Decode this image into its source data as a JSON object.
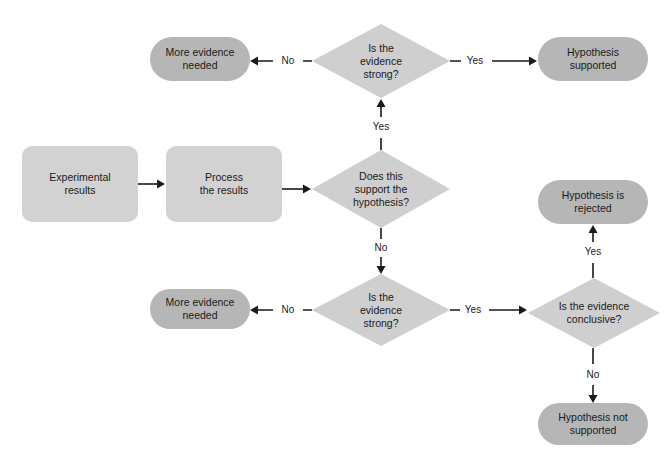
{
  "diagram": {
    "colors": {
      "terminal_fill": "#b6b6b6",
      "process_fill": "#d2d2d2",
      "decision_fill": "#cfcfcf",
      "line": "#1a1a1a",
      "background": "#ffffff",
      "text": "#1a1a1a"
    },
    "nodes": [
      {
        "id": "more-evidence-needed-top",
        "shape": "rounded-terminal",
        "label": "More evidence\nneeded",
        "x": 150,
        "y": 37,
        "w": 100,
        "h": 44,
        "fill": "#b6b6b6"
      },
      {
        "id": "is-the-evidence-strong-top",
        "shape": "diamond",
        "label": "Is the\nevidence\nstrong?",
        "x": 312,
        "y": 24,
        "w": 138,
        "h": 74,
        "fill": "#cfcfcf"
      },
      {
        "id": "hypothesis-supported",
        "shape": "rounded-terminal",
        "label": "Hypothesis\nsupported",
        "x": 538,
        "y": 37,
        "w": 110,
        "h": 44,
        "fill": "#b6b6b6"
      },
      {
        "id": "experimental-results",
        "shape": "process",
        "label": "Experimental\nresults",
        "x": 22,
        "y": 146,
        "w": 116,
        "h": 76,
        "fill": "#d2d2d2"
      },
      {
        "id": "process-the-results",
        "shape": "process",
        "label": "Process\nthe results",
        "x": 166,
        "y": 146,
        "w": 116,
        "h": 76,
        "fill": "#d2d2d2"
      },
      {
        "id": "does-this-support-the-hypothesis",
        "shape": "diamond",
        "label": "Does this\nsupport the\nhypothesis?",
        "x": 312,
        "y": 150,
        "w": 138,
        "h": 78,
        "fill": "#cfcfcf"
      },
      {
        "id": "hypothesis-is-rejected",
        "shape": "rounded-terminal",
        "label": "Hypothesis is\nrejected",
        "x": 538,
        "y": 180,
        "w": 110,
        "h": 44,
        "fill": "#b6b6b6"
      },
      {
        "id": "more-evidence-needed-bottom",
        "shape": "rounded-terminal",
        "label": "More evidence\nneeded",
        "x": 150,
        "y": 289,
        "w": 100,
        "h": 40,
        "fill": "#b6b6b6"
      },
      {
        "id": "is-the-evidence-strong-bottom",
        "shape": "diamond",
        "label": "Is the\nevidence\nstrong?",
        "x": 312,
        "y": 274,
        "w": 138,
        "h": 72,
        "fill": "#cfcfcf"
      },
      {
        "id": "is-the-evidence-conclusive",
        "shape": "diamond",
        "label": "Is the evidence\nconclusive?",
        "x": 528,
        "y": 278,
        "w": 132,
        "h": 70,
        "fill": "#cfcfcf"
      },
      {
        "id": "hypothesis-not-supported",
        "shape": "rounded-terminal",
        "label": "Hypothesis not\nsupported",
        "x": 538,
        "y": 403,
        "w": 110,
        "h": 42,
        "fill": "#b6b6b6"
      }
    ],
    "edges": [
      {
        "id": "edge-strong-top-to-more-evidence",
        "from": "is-the-evidence-strong-top",
        "to": "more-evidence-needed-top",
        "label": "No",
        "label_x": 288,
        "label_y": 61,
        "path": "M 312 61 L 303 61 M 273 61 L 256 61",
        "arrow": "left",
        "arrow_x": 250,
        "arrow_y": 61
      },
      {
        "id": "edge-strong-top-to-hypothesis-supported",
        "from": "is-the-evidence-strong-top",
        "to": "hypothesis-supported",
        "label": "Yes",
        "label_x": 475,
        "label_y": 61,
        "path": "M 450 61 L 461 61 M 492 61 L 531 61",
        "arrow": "right",
        "arrow_x": 537,
        "arrow_y": 61
      },
      {
        "id": "edge-support-hypothesis-yes-up",
        "from": "does-this-support-the-hypothesis",
        "to": "is-the-evidence-strong-top",
        "label": "Yes",
        "label_x": 381,
        "label_y": 127,
        "path": "M 381 150 L 381 138 M 381 117 L 381 106",
        "arrow": "up",
        "arrow_x": 381,
        "arrow_y": 99
      },
      {
        "id": "edge-experimental-to-process",
        "from": "experimental-results",
        "to": "process-the-results",
        "label": "",
        "label_x": 152,
        "label_y": 184,
        "path": "M 138 184 L 159 184",
        "arrow": "right",
        "arrow_x": 165,
        "arrow_y": 184
      },
      {
        "id": "edge-process-to-decision",
        "from": "process-the-results",
        "to": "does-this-support-the-hypothesis",
        "label": "",
        "label_x": 297,
        "label_y": 189,
        "path": "M 282 189 L 305 189",
        "arrow": "right",
        "arrow_x": 311,
        "arrow_y": 189
      },
      {
        "id": "edge-support-hypothesis-no-down",
        "from": "does-this-support-the-hypothesis",
        "to": "is-the-evidence-strong-bottom",
        "label": "No",
        "label_x": 381,
        "label_y": 248,
        "path": "M 381 228 L 381 239 M 381 257 L 381 267",
        "arrow": "down",
        "arrow_x": 381,
        "arrow_y": 274
      },
      {
        "id": "edge-strong-bottom-to-more-evidence",
        "from": "is-the-evidence-strong-bottom",
        "to": "more-evidence-needed-bottom",
        "label": "No",
        "label_x": 288,
        "label_y": 310,
        "path": "M 312 310 L 303 310 M 273 310 L 256 310",
        "arrow": "left",
        "arrow_x": 250,
        "arrow_y": 310
      },
      {
        "id": "edge-strong-bottom-to-conclusive",
        "from": "is-the-evidence-strong-bottom",
        "to": "is-the-evidence-conclusive",
        "label": "Yes",
        "label_x": 473,
        "label_y": 310,
        "path": "M 450 310 L 460 310 M 489 310 L 521 310",
        "arrow": "right",
        "arrow_x": 527,
        "arrow_y": 310
      },
      {
        "id": "edge-conclusive-yes-up",
        "from": "is-the-evidence-conclusive",
        "to": "hypothesis-is-rejected",
        "label": "Yes",
        "label_x": 593,
        "label_y": 252,
        "path": "M 593 278 L 593 263 M 593 242 L 593 232",
        "arrow": "up",
        "arrow_x": 593,
        "arrow_y": 225
      },
      {
        "id": "edge-conclusive-no-down",
        "from": "is-the-evidence-conclusive",
        "to": "hypothesis-not-supported",
        "label": "No",
        "label_x": 593,
        "label_y": 375,
        "path": "M 593 348 L 593 364 M 593 385 L 593 396",
        "arrow": "down",
        "arrow_x": 593,
        "arrow_y": 403
      }
    ]
  }
}
